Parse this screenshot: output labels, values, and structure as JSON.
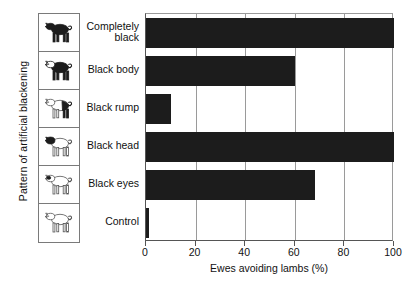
{
  "chart_data": {
    "type": "bar",
    "orientation": "horizontal",
    "title": "",
    "xlabel": "Ewes avoiding lambs (%)",
    "ylabel": "Pattern of artificial blackening",
    "categories": [
      "Completely\nblack",
      "Black body",
      "Black rump",
      "Black head",
      "Black eyes",
      "Control"
    ],
    "values": [
      100,
      60,
      10,
      100,
      68,
      1
    ],
    "xlim": [
      0,
      100
    ],
    "xticks": [
      0,
      20,
      40,
      60,
      80,
      100
    ],
    "xtick_labels": [
      "0",
      "20",
      "40",
      "60",
      "80",
      "100"
    ],
    "grid": true,
    "legend": "none",
    "bar_color": "#1c1c1c",
    "axis_color": "#555555"
  },
  "icons": [
    {
      "name": "sheep-completely-black-icon",
      "pattern": "completely-black"
    },
    {
      "name": "sheep-black-body-icon",
      "pattern": "black-body"
    },
    {
      "name": "sheep-black-rump-icon",
      "pattern": "black-rump"
    },
    {
      "name": "sheep-black-head-icon",
      "pattern": "black-head"
    },
    {
      "name": "sheep-black-eyes-icon",
      "pattern": "black-eyes"
    },
    {
      "name": "sheep-control-icon",
      "pattern": "control"
    }
  ]
}
